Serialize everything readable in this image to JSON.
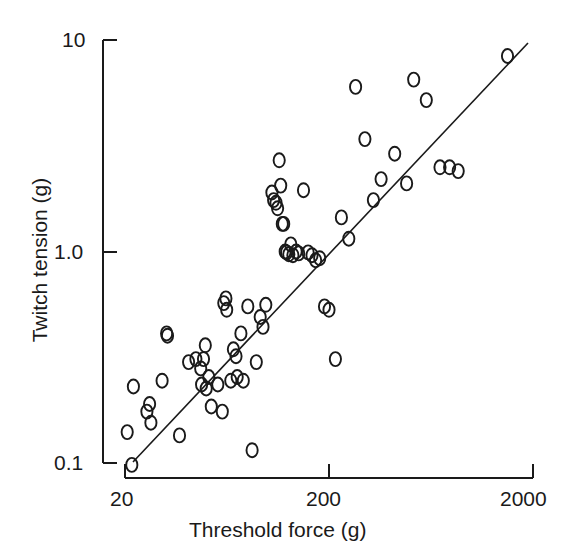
{
  "figure": {
    "background": "#ffffff",
    "ink_color": "#1a1a1a",
    "marker_glyph": "o (open circle)"
  },
  "axes": {
    "x_title": "Threshold force (g)",
    "y_title": "Twitch tension (g)",
    "x_ticks": [
      "20",
      "200",
      "2000"
    ],
    "y_ticks": [
      "10",
      "1.0",
      "0.1"
    ]
  },
  "chart_data": {
    "type": "scatter",
    "title": "",
    "xlabel": "Threshold force (g)",
    "ylabel": "Twitch tension (g)",
    "xscale": "log",
    "yscale": "log",
    "xlim": [
      20,
      2000
    ],
    "ylim": [
      0.1,
      10
    ],
    "xticks": [
      20,
      200,
      2000
    ],
    "yticks": [
      0.1,
      1.0,
      10
    ],
    "grid": false,
    "legend": null,
    "marker": "open-circle",
    "series": [
      {
        "name": "motor units",
        "points": [
          [
            20.5,
            0.14
          ],
          [
            21.6,
            0.098
          ],
          [
            22.0,
            0.23
          ],
          [
            25.6,
            0.175
          ],
          [
            26.4,
            0.19
          ],
          [
            26.8,
            0.155
          ],
          [
            30.4,
            0.245
          ],
          [
            32.0,
            0.41
          ],
          [
            32.3,
            0.4
          ],
          [
            37.0,
            0.135
          ],
          [
            41.0,
            0.3
          ],
          [
            44.5,
            0.31
          ],
          [
            47.0,
            0.28
          ],
          [
            47.5,
            0.235
          ],
          [
            48.5,
            0.31
          ],
          [
            49.5,
            0.36
          ],
          [
            50.0,
            0.225
          ],
          [
            51.5,
            0.255
          ],
          [
            53.0,
            0.185
          ],
          [
            57.0,
            0.235
          ],
          [
            60.0,
            0.175
          ],
          [
            61.0,
            0.57
          ],
          [
            62.5,
            0.6
          ],
          [
            63.0,
            0.53
          ],
          [
            66.0,
            0.245
          ],
          [
            68.0,
            0.345
          ],
          [
            70.0,
            0.32
          ],
          [
            71.0,
            0.255
          ],
          [
            74.0,
            0.41
          ],
          [
            76.0,
            0.245
          ],
          [
            80.0,
            0.55
          ],
          [
            84.0,
            0.115
          ],
          [
            88.0,
            0.3
          ],
          [
            92.0,
            0.49
          ],
          [
            95.0,
            0.44
          ],
          [
            98.0,
            0.56
          ],
          [
            105.0,
            1.9
          ],
          [
            107.0,
            1.75
          ],
          [
            110.0,
            1.7
          ],
          [
            112.0,
            1.6
          ],
          [
            114.0,
            2.7
          ],
          [
            116.0,
            2.05
          ],
          [
            118.0,
            1.35
          ],
          [
            120.0,
            1.35
          ],
          [
            122.0,
            1.0
          ],
          [
            124.0,
            0.99
          ],
          [
            127.0,
            0.97
          ],
          [
            130.0,
            1.08
          ],
          [
            133.0,
            0.96
          ],
          [
            138.0,
            1.0
          ],
          [
            142.0,
            0.98
          ],
          [
            150.0,
            1.95
          ],
          [
            158.0,
            0.99
          ],
          [
            165.0,
            0.96
          ],
          [
            172.0,
            0.91
          ],
          [
            180.0,
            0.93
          ],
          [
            190.0,
            0.55
          ],
          [
            200.0,
            0.53
          ],
          [
            215.0,
            0.31
          ],
          [
            230.0,
            1.45
          ],
          [
            250.0,
            1.15
          ],
          [
            270.0,
            6.0
          ],
          [
            300.0,
            3.4
          ],
          [
            330.0,
            1.75
          ],
          [
            360.0,
            2.2
          ],
          [
            420.0,
            2.9
          ],
          [
            480.0,
            2.1
          ],
          [
            520.0,
            6.5
          ],
          [
            600.0,
            5.2
          ],
          [
            700.0,
            2.5
          ],
          [
            780.0,
            2.5
          ],
          [
            860.0,
            2.4
          ],
          [
            1500.0,
            8.4
          ]
        ]
      }
    ],
    "fit_line": {
      "style": "solid",
      "x_range": [
        22.5,
        1850
      ],
      "y_range": [
        0.105,
        9.3
      ],
      "description": "regression line through scatter"
    }
  }
}
